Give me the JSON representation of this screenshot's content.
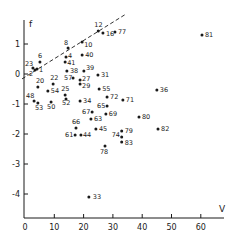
{
  "chart_data": {
    "type": "scatter",
    "title": "",
    "xlabel": "V",
    "ylabel": "f",
    "xlim": [
      0,
      68
    ],
    "ylim": [
      -4.8,
      1.9
    ],
    "x_ticks": [
      0,
      10,
      20,
      30,
      40,
      50,
      60
    ],
    "y_ticks": [
      1,
      0,
      -1,
      -2,
      -3,
      -4
    ],
    "grid": false,
    "legend": null,
    "reference_line": {
      "style": "dashed",
      "x": [
        0,
        34
      ],
      "y": [
        -0.13,
        1.97
      ]
    },
    "points": [
      {
        "label": "12",
        "x": 25.0,
        "y": 1.43
      },
      {
        "label": "16",
        "x": 26.6,
        "y": 1.37
      },
      {
        "label": "77",
        "x": 30.7,
        "y": 1.4
      },
      {
        "label": "81",
        "x": 60.4,
        "y": 1.3
      },
      {
        "label": "8",
        "x": 14.7,
        "y": 0.87
      },
      {
        "label": "10",
        "x": 19.5,
        "y": 1.07
      },
      {
        "label": "6",
        "x": 5.1,
        "y": 0.4
      },
      {
        "label": "23",
        "x": 2.7,
        "y": 0.2
      },
      {
        "label": "1",
        "x": 4.1,
        "y": 0.17
      },
      {
        "label": "2",
        "x": 3.4,
        "y": 0.13
      },
      {
        "label": "4",
        "x": 14.0,
        "y": 0.57
      },
      {
        "label": "41",
        "x": 13.7,
        "y": 0.4
      },
      {
        "label": "40",
        "x": 19.5,
        "y": 0.63
      },
      {
        "label": "38",
        "x": 14.3,
        "y": 0.1
      },
      {
        "label": "39",
        "x": 20.1,
        "y": 0.1
      },
      {
        "label": "31",
        "x": 24.9,
        "y": -0.03
      },
      {
        "label": "57",
        "x": 16.4,
        "y": -0.13
      },
      {
        "label": "27",
        "x": 18.8,
        "y": -0.2
      },
      {
        "label": "29",
        "x": 18.8,
        "y": -0.33
      },
      {
        "label": "22",
        "x": 9.6,
        "y": -0.33
      },
      {
        "label": "20",
        "x": 4.4,
        "y": -0.43
      },
      {
        "label": "54",
        "x": 7.8,
        "y": -0.57
      },
      {
        "label": "55",
        "x": 25.3,
        "y": -0.5
      },
      {
        "label": "36",
        "x": 45.0,
        "y": -0.53
      },
      {
        "label": "72",
        "x": 28.0,
        "y": -0.77
      },
      {
        "label": "71",
        "x": 33.4,
        "y": -0.87
      },
      {
        "label": "25",
        "x": 13.7,
        "y": -0.7
      },
      {
        "label": "52",
        "x": 14.0,
        "y": -0.83
      },
      {
        "label": "34",
        "x": 18.8,
        "y": -0.9
      },
      {
        "label": "48",
        "x": 3.1,
        "y": -0.9
      },
      {
        "label": "53",
        "x": 4.4,
        "y": -0.97
      },
      {
        "label": "50",
        "x": 8.9,
        "y": -0.93
      },
      {
        "label": "65",
        "x": 28.0,
        "y": -1.07
      },
      {
        "label": "69",
        "x": 27.6,
        "y": -1.33
      },
      {
        "label": "67",
        "x": 22.9,
        "y": -1.27
      },
      {
        "label": "63",
        "x": 22.5,
        "y": -1.5
      },
      {
        "label": "80",
        "x": 38.9,
        "y": -1.43
      },
      {
        "label": "82",
        "x": 45.4,
        "y": -1.83
      },
      {
        "label": "79",
        "x": 33.0,
        "y": -1.9
      },
      {
        "label": "45",
        "x": 24.2,
        "y": -1.83
      },
      {
        "label": "74",
        "x": 33.0,
        "y": -2.1
      },
      {
        "label": "83",
        "x": 33.0,
        "y": -2.27
      },
      {
        "label": "66",
        "x": 17.4,
        "y": -1.8
      },
      {
        "label": "61",
        "x": 17.1,
        "y": -2.03
      },
      {
        "label": "44",
        "x": 19.1,
        "y": -2.03
      },
      {
        "label": "78",
        "x": 27.3,
        "y": -2.4
      },
      {
        "label": "33",
        "x": 21.8,
        "y": -4.1
      }
    ]
  },
  "layout": {
    "label_offsets": {
      "12": [
        -4,
        -4,
        "start"
      ],
      "16": [
        3,
        3,
        "start"
      ],
      "77": [
        3,
        2,
        "start"
      ],
      "81": [
        3,
        2,
        "start"
      ],
      "8": [
        -4,
        -3,
        "start"
      ],
      "10": [
        2,
        5,
        "start"
      ],
      "6": [
        -2,
        -4,
        "start"
      ],
      "23": [
        -8,
        -2,
        "start"
      ],
      "1": [
        2,
        3,
        "start"
      ],
      "2": [
        -6,
        6,
        "start"
      ],
      "4": [
        2,
        1,
        "start"
      ],
      "41": [
        2,
        3,
        "start"
      ],
      "40": [
        3,
        2,
        "start"
      ],
      "38": [
        3,
        2,
        "start"
      ],
      "39": [
        2,
        -1,
        "start"
      ],
      "31": [
        3,
        2,
        "start"
      ],
      "57": [
        -9,
        2,
        "start"
      ],
      "27": [
        2,
        1,
        "start"
      ],
      "29": [
        2,
        4,
        "start"
      ],
      "22": [
        -3,
        -4,
        "start"
      ],
      "20": [
        -2,
        -4,
        "start"
      ],
      "54": [
        3,
        2,
        "start"
      ],
      "55": [
        3,
        2,
        "start"
      ],
      "36": [
        3,
        2,
        "start"
      ],
      "72": [
        3,
        2,
        "start"
      ],
      "71": [
        3,
        2,
        "start"
      ],
      "25": [
        -4,
        -4,
        "start"
      ],
      "52": [
        -4,
        6,
        "start"
      ],
      "34": [
        3,
        2,
        "start"
      ],
      "48": [
        -8,
        -3,
        "start"
      ],
      "53": [
        -3,
        7,
        "start"
      ],
      "50": [
        -4,
        7,
        "start"
      ],
      "65": [
        -10,
        2,
        "start"
      ],
      "69": [
        3,
        2,
        "start"
      ],
      "67": [
        -10,
        2,
        "start"
      ],
      "63": [
        3,
        2,
        "start"
      ],
      "80": [
        3,
        2,
        "start"
      ],
      "82": [
        3,
        2,
        "start"
      ],
      "79": [
        3,
        2,
        "start"
      ],
      "45": [
        3,
        2,
        "start"
      ],
      "74": [
        -10,
        0,
        "start"
      ],
      "83": [
        3,
        3,
        "start"
      ],
      "66": [
        -4,
        -4,
        "start"
      ],
      "61": [
        -10,
        2,
        "start"
      ],
      "44": [
        2,
        2,
        "start"
      ],
      "78": [
        -5,
        8,
        "start"
      ],
      "33": [
        4,
        2,
        "start"
      ]
    }
  }
}
